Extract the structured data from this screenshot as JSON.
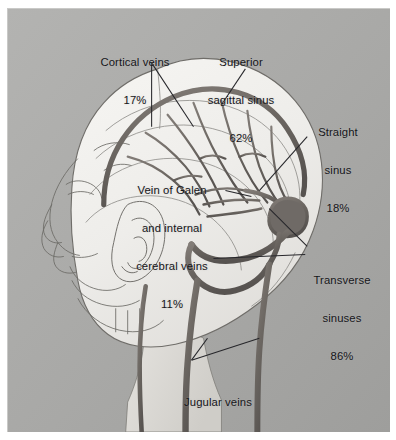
{
  "figure": {
    "background_color": "#a9a9a7",
    "head_fill_color": "#f0efec",
    "vessel_color": "#6f6a66",
    "line_color": "#4a4a4c",
    "text_color": "#16161a"
  },
  "labels": {
    "cortical_veins": {
      "lines": [
        "Cortical veins",
        "17%"
      ],
      "name": "Cortical veins",
      "value": "17%"
    },
    "superior_sagittal_sinus": {
      "lines": [
        "Superior",
        "sagittal sinus",
        "62%"
      ],
      "name": "Superior sagittal sinus",
      "value": "62%"
    },
    "straight_sinus": {
      "lines": [
        "Straight",
        "sinus",
        "18%"
      ],
      "name": "Straight sinus",
      "value": "18%"
    },
    "vein_of_galen": {
      "lines": [
        "Vein of Galen",
        "and internal",
        "cerebral veins",
        "11%"
      ],
      "name": "Vein of Galen and internal cerebral veins",
      "value": "11%"
    },
    "transverse_sinuses": {
      "lines": [
        "Transverse",
        "sinuses",
        "86%"
      ],
      "name": "Transverse sinuses",
      "value": "86%"
    },
    "jugular_veins": {
      "lines": [
        "Jugular veins",
        "12%"
      ],
      "name": "Jugular veins",
      "value": "12%"
    }
  }
}
